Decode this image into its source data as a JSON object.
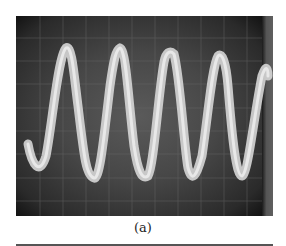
{
  "figure": {
    "caption": "(a)",
    "colors": {
      "screen": "#474747",
      "trace": "#d9d9d9",
      "background": "#ffffff"
    }
  }
}
